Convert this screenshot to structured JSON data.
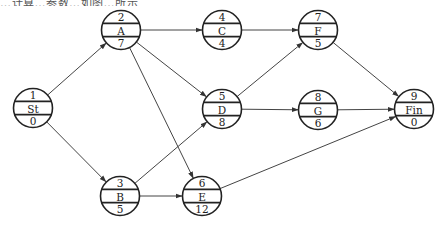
{
  "caption": "…计算…参数…如图…所示",
  "diagram": {
    "type": "activity-on-node network",
    "nodes": [
      {
        "id": "St",
        "top": "1",
        "label": "St",
        "bottom": "0",
        "cx": 33,
        "cy": 108
      },
      {
        "id": "A",
        "top": "2",
        "label": "A",
        "bottom": "7",
        "cx": 121,
        "cy": 30
      },
      {
        "id": "B",
        "top": "3",
        "label": "B",
        "bottom": "5",
        "cx": 120,
        "cy": 196
      },
      {
        "id": "C",
        "top": "4",
        "label": "C",
        "bottom": "4",
        "cx": 222,
        "cy": 30
      },
      {
        "id": "D",
        "top": "5",
        "label": "D",
        "bottom": "8",
        "cx": 222,
        "cy": 109
      },
      {
        "id": "E",
        "top": "6",
        "label": "E",
        "bottom": "12",
        "cx": 202,
        "cy": 196
      },
      {
        "id": "F",
        "top": "7",
        "label": "F",
        "bottom": "5",
        "cx": 318,
        "cy": 30
      },
      {
        "id": "G",
        "top": "8",
        "label": "G",
        "bottom": "6",
        "cx": 318,
        "cy": 110
      },
      {
        "id": "Fin",
        "top": "9",
        "label": "Fin",
        "bottom": "0",
        "cx": 414,
        "cy": 109
      }
    ],
    "edges": [
      {
        "from": "St",
        "to": "A"
      },
      {
        "from": "St",
        "to": "B"
      },
      {
        "from": "A",
        "to": "C"
      },
      {
        "from": "A",
        "to": "D"
      },
      {
        "from": "A",
        "to": "E"
      },
      {
        "from": "B",
        "to": "D"
      },
      {
        "from": "B",
        "to": "E"
      },
      {
        "from": "C",
        "to": "F"
      },
      {
        "from": "D",
        "to": "F"
      },
      {
        "from": "D",
        "to": "G"
      },
      {
        "from": "F",
        "to": "Fin"
      },
      {
        "from": "G",
        "to": "Fin"
      },
      {
        "from": "E",
        "to": "Fin"
      }
    ],
    "node_radius": 19.5,
    "colors": {
      "stroke": "#222222",
      "edge": "#444444",
      "background": "#ffffff"
    }
  }
}
